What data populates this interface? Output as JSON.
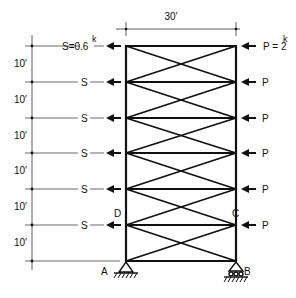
{
  "diagram": {
    "type": "braced-frame",
    "width_label": "30′",
    "story_height_label": "10′",
    "story_count": 6,
    "left_loads": {
      "first_label": "S=0.6",
      "first_unit": "k",
      "repeat_label": "S",
      "count": 6
    },
    "right_loads": {
      "first_label": "P = 2",
      "first_unit": "k",
      "repeat_label": "P",
      "count": 6
    },
    "nodes": {
      "A": "A",
      "B": "B",
      "C": "C",
      "D": "D"
    },
    "supports": {
      "A": "pin",
      "B": "roller"
    },
    "colors": {
      "line": "#111111",
      "background": "#ffffff"
    }
  }
}
